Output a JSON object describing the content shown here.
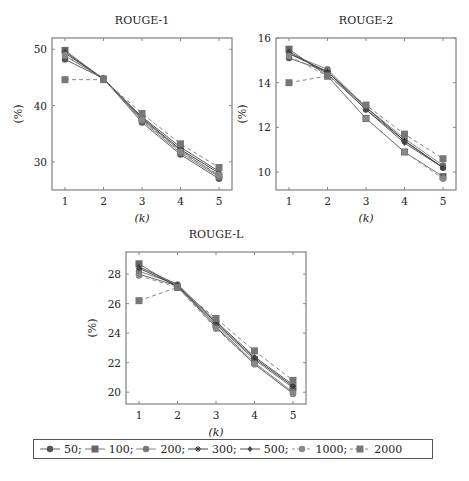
{
  "chart_data": [
    {
      "type": "line",
      "title": "ROUGE-1",
      "xlabel": "(k)",
      "ylabel": "(%)",
      "x": [
        1,
        2,
        3,
        4,
        5
      ],
      "ylim": [
        25,
        52
      ],
      "yticks": [
        30,
        40,
        50
      ],
      "series": [
        {
          "name": "50",
          "values": [
            48.2,
            44.8,
            37.0,
            31.3,
            27.0
          ]
        },
        {
          "name": "100",
          "values": [
            49.8,
            44.7,
            37.6,
            32.0,
            27.5
          ]
        },
        {
          "name": "200",
          "values": [
            48.8,
            44.8,
            37.3,
            31.6,
            27.3
          ]
        },
        {
          "name": "300",
          "values": [
            49.3,
            44.8,
            37.8,
            32.2,
            28.0
          ]
        },
        {
          "name": "500",
          "values": [
            49.6,
            44.6,
            38.0,
            32.6,
            28.3
          ]
        },
        {
          "name": "1000",
          "values": [
            49.0,
            44.7,
            37.5,
            31.8,
            27.7
          ]
        },
        {
          "name": "2000",
          "values": [
            44.6,
            44.6,
            38.6,
            33.2,
            29.0
          ]
        }
      ]
    },
    {
      "type": "line",
      "title": "ROUGE-2",
      "xlabel": "(k)",
      "ylabel": "(%)",
      "x": [
        1,
        2,
        3,
        4,
        5
      ],
      "ylim": [
        9.2,
        16
      ],
      "yticks": [
        10,
        12,
        14,
        16
      ],
      "series": [
        {
          "name": "50",
          "values": [
            15.1,
            14.5,
            12.8,
            11.4,
            10.2
          ]
        },
        {
          "name": "100",
          "values": [
            15.5,
            14.3,
            12.4,
            10.9,
            9.8
          ]
        },
        {
          "name": "200",
          "values": [
            15.3,
            14.6,
            12.9,
            11.5,
            10.3
          ]
        },
        {
          "name": "300",
          "values": [
            15.3,
            14.5,
            12.9,
            11.4,
            10.2
          ]
        },
        {
          "name": "500",
          "values": [
            15.4,
            14.4,
            12.8,
            11.3,
            10.2
          ]
        },
        {
          "name": "1000",
          "values": [
            15.2,
            14.3,
            12.4,
            10.9,
            9.7
          ]
        },
        {
          "name": "2000",
          "values": [
            14.0,
            14.3,
            13.0,
            11.7,
            10.6
          ]
        }
      ]
    },
    {
      "type": "line",
      "title": "ROUGE-L",
      "xlabel": "(k)",
      "ylabel": "(%)",
      "x": [
        1,
        2,
        3,
        4,
        5
      ],
      "ylim": [
        19.2,
        29.5
      ],
      "yticks": [
        20,
        22,
        24,
        26,
        28
      ],
      "series": [
        {
          "name": "50",
          "values": [
            28.0,
            27.2,
            24.4,
            21.9,
            19.9
          ]
        },
        {
          "name": "100",
          "values": [
            28.7,
            27.1,
            24.6,
            22.2,
            20.3
          ]
        },
        {
          "name": "200",
          "values": [
            28.2,
            27.3,
            24.5,
            22.0,
            20.0
          ]
        },
        {
          "name": "300",
          "values": [
            28.4,
            27.2,
            24.7,
            22.3,
            20.4
          ]
        },
        {
          "name": "500",
          "values": [
            28.5,
            27.3,
            24.8,
            22.4,
            20.5
          ]
        },
        {
          "name": "1000",
          "values": [
            27.9,
            27.1,
            24.3,
            21.9,
            19.9
          ]
        },
        {
          "name": "2000",
          "values": [
            26.2,
            27.1,
            25.0,
            22.8,
            20.8
          ]
        }
      ]
    }
  ],
  "legend": {
    "items": [
      {
        "label": "50;",
        "marker": "circle",
        "dash": false
      },
      {
        "label": "100;",
        "marker": "square",
        "dash": false
      },
      {
        "label": "200;",
        "marker": "circle",
        "dash": false
      },
      {
        "label": "300;",
        "marker": "star",
        "dash": false
      },
      {
        "label": "500;",
        "marker": "diamond",
        "dash": false
      },
      {
        "label": "1000;",
        "marker": "circle",
        "dash": true
      },
      {
        "label": "2000",
        "marker": "square",
        "dash": true
      }
    ]
  },
  "colors": {
    "series": [
      "#555555",
      "#666666",
      "#777777",
      "#333333",
      "#444444",
      "#888888",
      "#777777"
    ]
  }
}
